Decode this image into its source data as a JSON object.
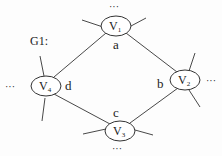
{
  "graph_label": "G1:",
  "nodes": [
    {
      "id": "V1",
      "label": "V",
      "sub": "1"
    },
    {
      "id": "V2",
      "label": "V",
      "sub": "2"
    },
    {
      "id": "V3",
      "label": "V",
      "sub": "3"
    },
    {
      "id": "V4",
      "label": "V",
      "sub": "4"
    }
  ],
  "edges": [
    {
      "from": "V1",
      "to": "V2",
      "label": "b"
    },
    {
      "from": "V2",
      "to": "V3",
      "label": "c"
    },
    {
      "from": "V3",
      "to": "V4",
      "label": "d"
    },
    {
      "from": "V4",
      "to": "V1",
      "label": "a"
    }
  ],
  "edge_labels": {
    "a": "a",
    "b": "b",
    "c": "c",
    "d": "d"
  },
  "ellipsis": "···"
}
